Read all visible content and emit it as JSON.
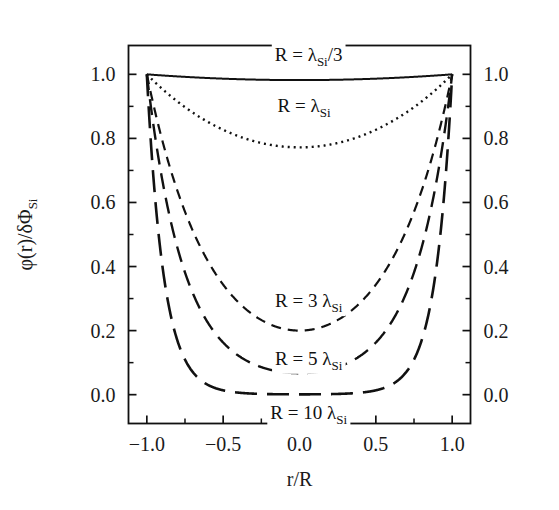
{
  "chart_data": {
    "type": "line",
    "title": "",
    "xlabel": "r/R",
    "ylabel": "φ(r)/δΦ",
    "ylabel_sub": "Si",
    "xlim": [
      -1.12,
      1.12
    ],
    "ylim": [
      -0.09,
      1.09
    ],
    "grid": false,
    "legend_position": "inline-annotations",
    "x_ticks": [
      -1.0,
      -0.5,
      0.0,
      0.5,
      1.0
    ],
    "x_tick_labels": [
      "−1.0",
      "−0.5",
      "0.0",
      "0.5",
      "1.0"
    ],
    "x_minor_ticks": [
      -1.25,
      -0.75,
      -0.25,
      0.25,
      0.75,
      1.25
    ],
    "y_ticks": [
      0.0,
      0.2,
      0.4,
      0.6,
      0.8,
      1.0
    ],
    "y_tick_labels": [
      "0.0",
      "0.2",
      "0.4",
      "0.6",
      "0.8",
      "1.0"
    ],
    "y_minor_ticks": [
      0.1,
      0.3,
      0.5,
      0.7,
      0.9,
      1.1
    ],
    "right_axis_labels": [
      "0.0",
      "0.2",
      "0.4",
      "0.6",
      "0.8",
      "1.0"
    ],
    "formula": "sinh(phi*x)/(x*sinh(phi))",
    "series": [
      {
        "name": "R = λSi/3",
        "label_prefix": "R = ",
        "label_lambda": "λ",
        "label_sub": "Si",
        "label_suffix": "/3",
        "phi": 0.3333,
        "dash": "none",
        "stroke_width": 2.0,
        "color": "#111111",
        "min_value": 0.982,
        "edge_value": 1.0,
        "label_x": 0.06,
        "label_y": 1.062
      },
      {
        "name": "R = λSi",
        "label_prefix": "R = ",
        "label_lambda": "λ",
        "label_sub": "Si",
        "label_suffix": "",
        "phi": 1.0,
        "dash": "2,4",
        "stroke_width": 2.4,
        "color": "#111111",
        "min_value": 0.772,
        "edge_value": 1.0,
        "label_x": 0.03,
        "label_y": 0.905
      },
      {
        "name": "R = 3 λSi",
        "label_prefix": "R = 3 ",
        "label_lambda": "λ",
        "label_sub": "Si",
        "label_suffix": "",
        "phi": 3.0,
        "dash": "10,7",
        "stroke_width": 2.2,
        "color": "#111111",
        "min_value": 0.2,
        "edge_value": 1.0,
        "label_x": 0.06,
        "label_y": 0.295
      },
      {
        "name": "R = 5 λSi",
        "label_prefix": "R = 5 ",
        "label_lambda": "λ",
        "label_sub": "Si",
        "label_suffix": "",
        "phi": 5.0,
        "dash": "16,9",
        "stroke_width": 2.4,
        "color": "#111111",
        "min_value": 0.067,
        "edge_value": 1.0,
        "label_x": 0.06,
        "label_y": 0.115
      },
      {
        "name": "R = 10 λSi",
        "label_prefix": "R = 10 ",
        "label_lambda": "λ",
        "label_sub": "Si",
        "label_suffix": "",
        "phi": 10.0,
        "dash": "22,10",
        "stroke_width": 2.6,
        "color": "#111111",
        "min_value": 0.001,
        "edge_value": 1.0,
        "label_x": 0.06,
        "label_y": -0.055
      }
    ]
  }
}
